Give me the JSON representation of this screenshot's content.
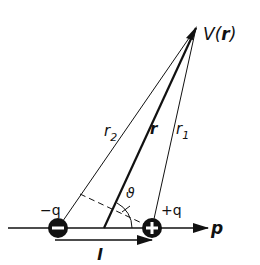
{
  "diagram": {
    "type": "electric-dipole",
    "labels": {
      "potential": "V(",
      "potential_vec": "r",
      "potential_close": ")",
      "r": "r",
      "r1": "r",
      "r1_sub": "1",
      "r2": "r",
      "r2_sub": "2",
      "theta": "ϑ",
      "neg_charge": "−q",
      "pos_charge": "+q",
      "dipole_moment": "p",
      "separation": "l"
    },
    "charges": [
      {
        "sign": "negative",
        "symbol": "−",
        "label": "−q"
      },
      {
        "sign": "positive",
        "symbol": "+",
        "label": "+q"
      }
    ],
    "colors": {
      "ink": "#111111",
      "background": "#ffffff",
      "charge_symbol": "#ffffff"
    }
  }
}
